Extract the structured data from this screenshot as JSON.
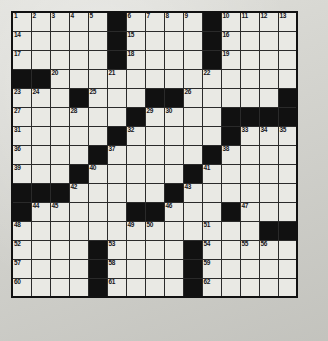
{
  "puzzle": {
    "type": "crossword-grid",
    "title": "Crossword Puzzle Grid",
    "rows": 15,
    "cols": 15,
    "cell_size_px": 20,
    "colors": {
      "page_background": "#d9d9d3",
      "white_cell": "#e9e9e4",
      "black_cell": "#111111",
      "grid_line": "#2a2a2a",
      "number_text": "#15151a"
    },
    "max_clue_number": 62,
    "grid": [
      [
        "1",
        "2",
        "3",
        "4",
        "5",
        "#",
        "6",
        "7",
        "8",
        "9",
        "#",
        "10",
        "11",
        "12",
        "13"
      ],
      [
        "14",
        "",
        "",
        "",
        "",
        "#",
        "15",
        "",
        "",
        "",
        "#",
        "16",
        "",
        "",
        ""
      ],
      [
        "17",
        "",
        "",
        "",
        "",
        "#",
        "18",
        "",
        "",
        "",
        "#",
        "19",
        "",
        "",
        ""
      ],
      [
        "#",
        "#",
        "20",
        "",
        "",
        "21",
        "",
        "",
        "",
        "",
        "22",
        "",
        "",
        "",
        ""
      ],
      [
        "23",
        "24",
        "",
        "#",
        "25",
        "",
        "",
        "#",
        "#",
        "26",
        "",
        "",
        "",
        "",
        "#"
      ],
      [
        "27",
        "",
        "",
        "28",
        "",
        "",
        "#",
        "29",
        "30",
        "",
        "",
        "#",
        "#",
        "#",
        "#"
      ],
      [
        "31",
        "",
        "",
        "",
        "",
        "#",
        "32",
        "",
        "",
        "",
        "",
        "#",
        "33",
        "34",
        "35"
      ],
      [
        "36",
        "",
        "",
        "",
        "#",
        "37",
        "",
        "",
        "",
        "",
        "#",
        "38",
        "",
        "",
        ""
      ],
      [
        "39",
        "",
        "",
        "#",
        "40",
        "",
        "",
        "",
        "",
        "#",
        "41",
        "",
        "",
        "",
        ""
      ],
      [
        "#",
        "#",
        "#",
        "42",
        "",
        "",
        "",
        "",
        "#",
        "43",
        "",
        "",
        "",
        "",
        ""
      ],
      [
        "#",
        "44",
        "45",
        "",
        "",
        "",
        "#",
        "#",
        "46",
        "",
        "",
        "#",
        "47",
        "",
        ""
      ],
      [
        "48",
        "",
        "",
        "",
        "",
        "",
        "49",
        "50",
        "",
        "",
        "51",
        "",
        "",
        "#",
        "#"
      ],
      [
        "52",
        "",
        "",
        "",
        "#",
        "53",
        "",
        "",
        "",
        "#",
        "54",
        "",
        "55",
        "56",
        ""
      ],
      [
        "57",
        "",
        "",
        "",
        "#",
        "58",
        "",
        "",
        "",
        "#",
        "59",
        "",
        "",
        "",
        ""
      ],
      [
        "60",
        "",
        "",
        "",
        "#",
        "61",
        "",
        "",
        "",
        "#",
        "62",
        "",
        "",
        "",
        ""
      ]
    ],
    "numbers_visible": [
      "1",
      "2",
      "3",
      "4",
      "5",
      "6",
      "7",
      "8",
      "9",
      "10",
      "11",
      "12",
      "13",
      "14",
      "15",
      "16",
      "17",
      "18",
      "19",
      "20",
      "21",
      "22",
      "23",
      "24",
      "25",
      "26",
      "27",
      "28",
      "29",
      "30",
      "31",
      "32",
      "33",
      "34",
      "35",
      "36",
      "37",
      "38",
      "39",
      "40",
      "41",
      "42",
      "43",
      "44",
      "45",
      "46",
      "47",
      "48",
      "49",
      "50",
      "51",
      "52",
      "53",
      "54",
      "55",
      "56",
      "57",
      "58",
      "59",
      "60",
      "61",
      "62"
    ]
  }
}
